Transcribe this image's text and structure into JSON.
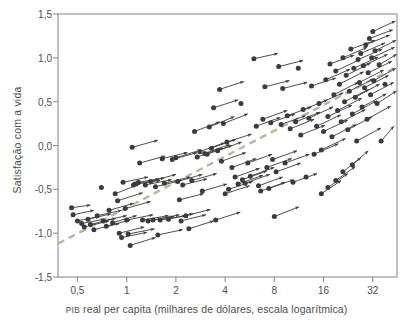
{
  "figure": {
    "name": "satisfacao-vs-pib-scatter",
    "background": "#ffffff",
    "plot_frame": {
      "left": 58,
      "top": 14,
      "right": 397,
      "bottom": 277
    },
    "frame_color": "#8d8d8b",
    "arrow_color": "#3b3b3d",
    "trend_color": "#b8b79c"
  },
  "chart_data": {
    "type": "scatter",
    "title": "",
    "subtitle": "",
    "xlabel": "PIB real per capita (milhares de dólares, escala logarítmica)",
    "xlabel_smallcaps_prefix": "PIB",
    "xlabel_rest": " real per capita (milhares de dólares, escala logarítmica)",
    "ylabel": "Satisfação com a vida",
    "x_scale": "log2",
    "x_ticks": [
      0.5,
      1,
      2,
      4,
      8,
      16,
      32
    ],
    "x_tick_labels": [
      "0,5",
      "1",
      "2",
      "4",
      "8",
      "16",
      "32"
    ],
    "xlim": [
      0.38,
      45
    ],
    "y_ticks": [
      1.5,
      1.0,
      0.5,
      0.0,
      -0.5,
      -1.0,
      -1.5
    ],
    "y_tick_labels": [
      "1,5",
      "1,0",
      "0,5",
      "0,0",
      "-0,5",
      "-1,0",
      "-1,5"
    ],
    "ylim": [
      -1.5,
      1.5
    ],
    "grid": false,
    "legend": "none",
    "marker": "filled-circle-at-arrow-tail",
    "annotations": [],
    "trend_line": {
      "style": "dashed",
      "color": "#b8b79c",
      "x_start": 0.38,
      "y_start": -1.12,
      "x_end": 45,
      "y_end": 0.9
    },
    "series": [
      {
        "name": "Países: trajetória de crescimento (seta = variação ao longo do tempo)",
        "type": "vector-arrows",
        "arrows": [
          {
            "x0": 0.46,
            "y0": -0.71,
            "x1": 0.6,
            "y1": -0.68
          },
          {
            "x0": 0.47,
            "y0": -0.79,
            "x1": 0.63,
            "y1": -0.74
          },
          {
            "x0": 0.5,
            "y0": -0.86,
            "x1": 0.68,
            "y1": -0.81
          },
          {
            "x0": 0.53,
            "y0": -0.89,
            "x1": 0.73,
            "y1": -0.84
          },
          {
            "x0": 0.55,
            "y0": -0.93,
            "x1": 0.78,
            "y1": -0.86
          },
          {
            "x0": 0.58,
            "y0": -0.84,
            "x1": 0.8,
            "y1": -0.78
          },
          {
            "x0": 0.6,
            "y0": -0.9,
            "x1": 0.86,
            "y1": -0.83
          },
          {
            "x0": 0.63,
            "y0": -0.96,
            "x1": 0.9,
            "y1": -0.89
          },
          {
            "x0": 0.66,
            "y0": -0.8,
            "x1": 0.93,
            "y1": -0.74
          },
          {
            "x0": 0.7,
            "y0": -0.48,
            "x1": 0.7,
            "y1": -0.48
          },
          {
            "x0": 0.72,
            "y0": -0.86,
            "x1": 1.0,
            "y1": -0.8
          },
          {
            "x0": 0.75,
            "y0": -0.92,
            "x1": 1.05,
            "y1": -0.85
          },
          {
            "x0": 0.78,
            "y0": -0.74,
            "x1": 1.1,
            "y1": -0.66
          },
          {
            "x0": 0.82,
            "y0": -0.88,
            "x1": 1.15,
            "y1": -0.8
          },
          {
            "x0": 0.85,
            "y0": -0.55,
            "x1": 1.2,
            "y1": -0.44
          },
          {
            "x0": 0.88,
            "y0": -0.63,
            "x1": 1.25,
            "y1": -0.54
          },
          {
            "x0": 0.9,
            "y0": -1.0,
            "x1": 1.28,
            "y1": -0.93
          },
          {
            "x0": 0.93,
            "y0": -1.05,
            "x1": 1.33,
            "y1": -0.99
          },
          {
            "x0": 0.95,
            "y0": -0.42,
            "x1": 1.35,
            "y1": -0.36
          },
          {
            "x0": 0.98,
            "y0": -0.72,
            "x1": 1.4,
            "y1": -0.64
          },
          {
            "x0": 1.0,
            "y0": -0.85,
            "x1": 1.45,
            "y1": -0.79
          },
          {
            "x0": 1.02,
            "y0": -1.01,
            "x1": 1.48,
            "y1": -0.95
          },
          {
            "x0": 1.05,
            "y0": -1.14,
            "x1": 1.5,
            "y1": -1.05
          },
          {
            "x0": 1.08,
            "y0": -0.02,
            "x1": 1.55,
            "y1": 0.06
          },
          {
            "x0": 1.1,
            "y0": -0.45,
            "x1": 1.58,
            "y1": -0.38
          },
          {
            "x0": 1.12,
            "y0": -0.44,
            "x1": 1.6,
            "y1": -0.4
          },
          {
            "x0": 1.18,
            "y0": -0.42,
            "x1": 1.7,
            "y1": -0.37
          },
          {
            "x0": 1.2,
            "y0": -0.2,
            "x1": 1.72,
            "y1": -0.12
          },
          {
            "x0": 1.25,
            "y0": -0.85,
            "x1": 1.8,
            "y1": -0.8
          },
          {
            "x0": 1.3,
            "y0": -0.45,
            "x1": 1.88,
            "y1": -0.39
          },
          {
            "x0": 1.35,
            "y0": -0.86,
            "x1": 1.95,
            "y1": -0.81
          },
          {
            "x0": 1.4,
            "y0": -0.41,
            "x1": 2.0,
            "y1": -0.33
          },
          {
            "x0": 1.45,
            "y0": -0.85,
            "x1": 2.1,
            "y1": -0.79
          },
          {
            "x0": 1.5,
            "y0": -0.47,
            "x1": 2.15,
            "y1": -0.4
          },
          {
            "x0": 1.55,
            "y0": -1.02,
            "x1": 2.2,
            "y1": -0.96
          },
          {
            "x0": 1.6,
            "y0": -0.85,
            "x1": 2.3,
            "y1": -0.8
          },
          {
            "x0": 1.65,
            "y0": -0.15,
            "x1": 2.35,
            "y1": -0.08
          },
          {
            "x0": 1.7,
            "y0": -0.43,
            "x1": 2.45,
            "y1": -0.36
          },
          {
            "x0": 1.8,
            "y0": -0.84,
            "x1": 2.55,
            "y1": -0.78
          },
          {
            "x0": 1.9,
            "y0": -0.16,
            "x1": 2.7,
            "y1": -0.08
          },
          {
            "x0": 2.0,
            "y0": -0.14,
            "x1": 2.85,
            "y1": -0.05
          },
          {
            "x0": 2.05,
            "y0": -0.41,
            "x1": 2.9,
            "y1": -0.33
          },
          {
            "x0": 2.1,
            "y0": -0.62,
            "x1": 2.95,
            "y1": -0.55
          },
          {
            "x0": 2.15,
            "y0": -0.86,
            "x1": 3.05,
            "y1": -0.79
          },
          {
            "x0": 2.2,
            "y0": -0.45,
            "x1": 3.1,
            "y1": -0.38
          },
          {
            "x0": 2.3,
            "y0": -0.8,
            "x1": 3.25,
            "y1": -0.73
          },
          {
            "x0": 2.4,
            "y0": -0.95,
            "x1": 3.4,
            "y1": -0.86
          },
          {
            "x0": 2.5,
            "y0": -0.4,
            "x1": 3.55,
            "y1": -0.32
          },
          {
            "x0": 2.6,
            "y0": 0.16,
            "x1": 3.7,
            "y1": 0.27
          },
          {
            "x0": 2.7,
            "y0": -0.13,
            "x1": 3.85,
            "y1": -0.03
          },
          {
            "x0": 2.8,
            "y0": -0.07,
            "x1": 3.95,
            "y1": 0.03
          },
          {
            "x0": 2.9,
            "y0": -0.52,
            "x1": 4.1,
            "y1": -0.44
          },
          {
            "x0": 3.0,
            "y0": -0.09,
            "x1": 4.25,
            "y1": 0.01
          },
          {
            "x0": 3.1,
            "y0": -0.1,
            "x1": 4.4,
            "y1": 0.0
          },
          {
            "x0": 3.2,
            "y0": 0.21,
            "x1": 4.55,
            "y1": 0.33
          },
          {
            "x0": 3.3,
            "y0": -0.03,
            "x1": 4.65,
            "y1": 0.07
          },
          {
            "x0": 3.4,
            "y0": 0.43,
            "x1": 4.8,
            "y1": 0.52
          },
          {
            "x0": 3.5,
            "y0": -0.85,
            "x1": 4.95,
            "y1": -0.76
          },
          {
            "x0": 3.6,
            "y0": -0.06,
            "x1": 5.05,
            "y1": 0.04
          },
          {
            "x0": 3.7,
            "y0": 0.64,
            "x1": 5.2,
            "y1": 0.73
          },
          {
            "x0": 3.8,
            "y0": -0.18,
            "x1": 5.35,
            "y1": -0.08
          },
          {
            "x0": 3.9,
            "y0": 0.25,
            "x1": 5.5,
            "y1": 0.36
          },
          {
            "x0": 4.0,
            "y0": -0.55,
            "x1": 5.65,
            "y1": -0.46
          },
          {
            "x0": 4.1,
            "y0": 0.04,
            "x1": 5.8,
            "y1": 0.13
          },
          {
            "x0": 4.2,
            "y0": -0.5,
            "x1": 5.9,
            "y1": -0.41
          },
          {
            "x0": 4.4,
            "y0": -0.25,
            "x1": 6.2,
            "y1": -0.15
          },
          {
            "x0": 4.6,
            "y0": -0.36,
            "x1": 6.5,
            "y1": -0.26
          },
          {
            "x0": 4.8,
            "y0": -0.44,
            "x1": 6.8,
            "y1": -0.34
          },
          {
            "x0": 5.0,
            "y0": 0.48,
            "x1": 5.0,
            "y1": 0.48
          },
          {
            "x0": 5.1,
            "y0": -0.39,
            "x1": 7.2,
            "y1": -0.29
          },
          {
            "x0": 5.3,
            "y0": -0.43,
            "x1": 7.5,
            "y1": -0.33
          },
          {
            "x0": 5.5,
            "y0": -0.2,
            "x1": 7.75,
            "y1": -0.1
          },
          {
            "x0": 5.7,
            "y0": -0.35,
            "x1": 8.0,
            "y1": -0.25
          },
          {
            "x0": 6.0,
            "y0": 0.99,
            "x1": 8.4,
            "y1": 1.05
          },
          {
            "x0": 6.2,
            "y0": 0.22,
            "x1": 8.7,
            "y1": 0.32
          },
          {
            "x0": 6.4,
            "y0": -0.46,
            "x1": 9.0,
            "y1": -0.36
          },
          {
            "x0": 6.6,
            "y0": -0.52,
            "x1": 9.3,
            "y1": -0.42
          },
          {
            "x0": 6.8,
            "y0": 0.3,
            "x1": 9.6,
            "y1": 0.4
          },
          {
            "x0": 7.0,
            "y0": 0.67,
            "x1": 9.9,
            "y1": 0.74
          },
          {
            "x0": 7.2,
            "y0": -0.25,
            "x1": 10.2,
            "y1": -0.15
          },
          {
            "x0": 7.4,
            "y0": -0.49,
            "x1": 10.5,
            "y1": -0.39
          },
          {
            "x0": 7.6,
            "y0": 0.26,
            "x1": 10.7,
            "y1": 0.36
          },
          {
            "x0": 7.8,
            "y0": -0.16,
            "x1": 11.0,
            "y1": -0.06
          },
          {
            "x0": 8.0,
            "y0": -0.81,
            "x1": 11.3,
            "y1": -0.7
          },
          {
            "x0": 8.2,
            "y0": -0.3,
            "x1": 11.6,
            "y1": -0.2
          },
          {
            "x0": 8.5,
            "y0": 0.9,
            "x1": 12.0,
            "y1": 0.97
          },
          {
            "x0": 8.8,
            "y0": 0.24,
            "x1": 12.4,
            "y1": 0.34
          },
          {
            "x0": 9.0,
            "y0": 0.65,
            "x1": 12.7,
            "y1": 0.72
          },
          {
            "x0": 9.3,
            "y0": -0.2,
            "x1": 13.1,
            "y1": -0.1
          },
          {
            "x0": 9.6,
            "y0": 0.34,
            "x1": 13.5,
            "y1": 0.44
          },
          {
            "x0": 10.0,
            "y0": 0.19,
            "x1": 14.0,
            "y1": 0.3
          },
          {
            "x0": 10.4,
            "y0": -0.42,
            "x1": 14.6,
            "y1": -0.32
          },
          {
            "x0": 10.8,
            "y0": 0.27,
            "x1": 15.2,
            "y1": 0.38
          },
          {
            "x0": 11.2,
            "y0": 0.88,
            "x1": 11.2,
            "y1": 0.88
          },
          {
            "x0": 11.6,
            "y0": 0.12,
            "x1": 16.3,
            "y1": 0.23
          },
          {
            "x0": 12.0,
            "y0": 0.41,
            "x1": 16.9,
            "y1": 0.52
          },
          {
            "x0": 12.5,
            "y0": -0.36,
            "x1": 12.5,
            "y1": -0.36
          },
          {
            "x0": 13.0,
            "y0": 0.31,
            "x1": 18.3,
            "y1": 0.44
          },
          {
            "x0": 13.5,
            "y0": 0.68,
            "x1": 19.0,
            "y1": 0.77
          },
          {
            "x0": 14.0,
            "y0": -0.1,
            "x1": 19.7,
            "y1": 0.02
          },
          {
            "x0": 14.5,
            "y0": 0.22,
            "x1": 20.4,
            "y1": 0.35
          },
          {
            "x0": 15.0,
            "y0": 0.48,
            "x1": 21.1,
            "y1": 0.6
          },
          {
            "x0": 15.5,
            "y0": -0.05,
            "x1": 21.8,
            "y1": 0.08
          },
          {
            "x0": 16.0,
            "y0": 0.16,
            "x1": 22.5,
            "y1": 0.29
          },
          {
            "x0": 16.5,
            "y0": 0.75,
            "x1": 23.2,
            "y1": 0.87
          },
          {
            "x0": 17.0,
            "y0": 0.33,
            "x1": 23.9,
            "y1": 0.46
          },
          {
            "x0": 17.5,
            "y0": 0.93,
            "x1": 24.6,
            "y1": 1.03
          },
          {
            "x0": 18.0,
            "y0": 0.1,
            "x1": 25.3,
            "y1": 0.24
          },
          {
            "x0": 18.5,
            "y0": 0.58,
            "x1": 26.0,
            "y1": 0.72
          },
          {
            "x0": 19.0,
            "y0": 0.85,
            "x1": 26.7,
            "y1": 0.98
          },
          {
            "x0": 19.5,
            "y0": 0.4,
            "x1": 27.4,
            "y1": 0.54
          },
          {
            "x0": 20.0,
            "y0": 0.7,
            "x1": 28.1,
            "y1": 0.84
          },
          {
            "x0": 20.5,
            "y0": 0.27,
            "x1": 28.8,
            "y1": 0.41
          },
          {
            "x0": 21.0,
            "y0": 1.0,
            "x1": 29.5,
            "y1": 1.12
          },
          {
            "x0": 21.5,
            "y0": 0.5,
            "x1": 30.2,
            "y1": 0.64
          },
          {
            "x0": 22.0,
            "y0": 0.8,
            "x1": 31.0,
            "y1": 0.94
          },
          {
            "x0": 22.5,
            "y0": 0.18,
            "x1": 31.7,
            "y1": 0.33
          },
          {
            "x0": 23.0,
            "y0": 0.62,
            "x1": 32.4,
            "y1": 0.76
          },
          {
            "x0": 23.5,
            "y0": 1.1,
            "x1": 33.1,
            "y1": 1.2
          },
          {
            "x0": 24.0,
            "y0": 0.36,
            "x1": 33.8,
            "y1": 0.51
          },
          {
            "x0": 24.5,
            "y0": 0.88,
            "x1": 34.5,
            "y1": 1.01
          },
          {
            "x0": 25.0,
            "y0": 0.55,
            "x1": 35.2,
            "y1": 0.7
          },
          {
            "x0": 25.5,
            "y0": 0.05,
            "x1": 35.9,
            "y1": 0.2
          },
          {
            "x0": 26.0,
            "y0": 0.98,
            "x1": 36.6,
            "y1": 1.1
          },
          {
            "x0": 26.5,
            "y0": 0.72,
            "x1": 37.3,
            "y1": 0.86
          },
          {
            "x0": 27.0,
            "y0": 1.05,
            "x1": 38.0,
            "y1": 1.17
          },
          {
            "x0": 27.5,
            "y0": 0.44,
            "x1": 38.7,
            "y1": 0.59
          },
          {
            "x0": 28.0,
            "y0": 0.91,
            "x1": 39.4,
            "y1": 1.04
          },
          {
            "x0": 28.5,
            "y0": 0.66,
            "x1": 40.0,
            "y1": 0.8
          },
          {
            "x0": 29.0,
            "y0": 1.15,
            "x1": 40.6,
            "y1": 1.26
          },
          {
            "x0": 29.5,
            "y0": 0.3,
            "x1": 41.2,
            "y1": 0.45
          },
          {
            "x0": 30.0,
            "y0": 0.83,
            "x1": 41.8,
            "y1": 0.96
          },
          {
            "x0": 30.5,
            "y0": 1.22,
            "x1": 42.4,
            "y1": 1.32
          },
          {
            "x0": 31.0,
            "y0": 0.58,
            "x1": 43.0,
            "y1": 0.72
          },
          {
            "x0": 31.5,
            "y0": 1.0,
            "x1": 43.5,
            "y1": 1.12
          },
          {
            "x0": 32.0,
            "y0": 1.3,
            "x1": 44.0,
            "y1": 1.42
          },
          {
            "x0": 32.5,
            "y0": 0.74,
            "x1": 44.2,
            "y1": 0.88
          },
          {
            "x0": 33.0,
            "y0": 1.08,
            "x1": 44.4,
            "y1": 1.2
          },
          {
            "x0": 34.0,
            "y0": 0.48,
            "x1": 44.6,
            "y1": 0.62
          },
          {
            "x0": 35.0,
            "y0": 0.92,
            "x1": 44.8,
            "y1": 1.04
          },
          {
            "x0": 36.0,
            "y0": 0.05,
            "x1": 43.0,
            "y1": 0.22
          },
          {
            "x0": 38.0,
            "y0": 0.7,
            "x1": 38.0,
            "y1": 0.7
          },
          {
            "x0": 24.0,
            "y0": -0.22,
            "x1": 30.0,
            "y1": -0.06
          },
          {
            "x0": 21.0,
            "y0": -0.3,
            "x1": 27.0,
            "y1": -0.14
          },
          {
            "x0": 19.0,
            "y0": -0.4,
            "x1": 25.0,
            "y1": -0.24
          },
          {
            "x0": 17.0,
            "y0": -0.48,
            "x1": 22.5,
            "y1": -0.32
          },
          {
            "x0": 15.5,
            "y0": -0.55,
            "x1": 20.5,
            "y1": -0.4
          }
        ]
      }
    ]
  },
  "axes": {
    "y_title": "Satisfação com a vida",
    "x_title_prefix": "PIB",
    "x_title_rest": " real per capita (milhares de dólares, escala logarítmica)"
  }
}
